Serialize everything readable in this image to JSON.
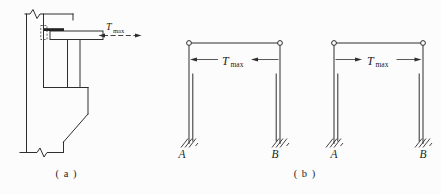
{
  "figure": {
    "background_color": "#fcfcfc",
    "line_color": "#2e2e2e",
    "panel_a": {
      "caption": "( a )",
      "description": "crane girder on column corbel, bidirectional horizontal force at top flange",
      "force": {
        "symbol": "T",
        "sub": "max",
        "arrow_direction": "both"
      }
    },
    "panel_b": {
      "caption": "( b )",
      "frames": [
        {
          "force": {
            "symbol": "T",
            "sub": "max",
            "arrow_direction": "leftward"
          },
          "left_support": "A",
          "right_support": "B"
        },
        {
          "force": {
            "symbol": "T",
            "sub": "max",
            "arrow_direction": "rightward"
          },
          "left_support": "A",
          "right_support": "B"
        }
      ]
    }
  }
}
